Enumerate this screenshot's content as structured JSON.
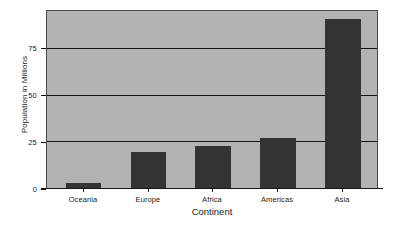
{
  "chart_data": {
    "type": "bar",
    "title": "",
    "xlabel": "Continent",
    "ylabel": "Population in Millions",
    "categories": [
      "Oceania",
      "Europe",
      "Africa",
      "Americas",
      "Asia"
    ],
    "values": [
      2.7,
      19.1,
      22.3,
      27.0,
      90.5
    ],
    "ylim": [
      0,
      95
    ],
    "yticks": [
      0,
      25,
      50,
      75
    ],
    "ytick_labels": [
      "0",
      "25",
      "50",
      "75"
    ],
    "grid": "horizontal gridlines at 25, 50, 75",
    "legend": "none",
    "bar_color": "#333333",
    "plot_background": "#b3b3b3",
    "figure_background": "#ffffff",
    "gridline_color": "#151515",
    "axis_color": "#151515"
  }
}
